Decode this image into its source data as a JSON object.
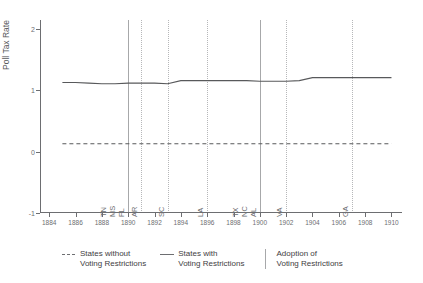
{
  "figure": {
    "title": "",
    "background": "#ffffff",
    "ink_color": "#6d6e71",
    "grid_color": "#b6b7b9"
  },
  "axes": {
    "y_title": "Poll Tax Rate",
    "y_ticks": [
      {
        "value": 2,
        "label": "2"
      },
      {
        "value": 1,
        "label": "1"
      },
      {
        "value": 0,
        "label": "0"
      },
      {
        "value": -1,
        "label": "-1"
      }
    ],
    "y_range": [
      -1,
      2.15
    ],
    "x_ticks": [
      {
        "value": 1884,
        "label": "1884"
      },
      {
        "value": 1886,
        "label": "1886"
      },
      {
        "value": 1888,
        "label": "1888"
      },
      {
        "value": 1890,
        "label": "1890"
      },
      {
        "value": 1892,
        "label": "1892"
      },
      {
        "value": 1894,
        "label": "1894"
      },
      {
        "value": 1896,
        "label": "1896"
      },
      {
        "value": 1898,
        "label": "1898"
      },
      {
        "value": 1900,
        "label": "1900"
      },
      {
        "value": 1902,
        "label": "1902"
      },
      {
        "value": 1904,
        "label": "1904"
      },
      {
        "value": 1906,
        "label": "1906"
      },
      {
        "value": 1908,
        "label": "1908"
      },
      {
        "value": 1910,
        "label": "1910"
      }
    ],
    "x_range": [
      1883.3,
      1910.8
    ],
    "grid": false
  },
  "legend": {
    "position": "below-plot",
    "entries": [
      {
        "marker": "dashed-line",
        "line1": "States without",
        "line2": "Voting Restrictions"
      },
      {
        "marker": "solid-line",
        "line1": "States with",
        "line2": "Voting Restrictions"
      },
      {
        "marker": "vertical-line",
        "line1": "Adoption of",
        "line2": "Voting Restrictions"
      }
    ]
  },
  "events": [
    {
      "year": 1890,
      "labels": [
        "FL",
        "MS",
        "TN"
      ]
    },
    {
      "year": 1891,
      "labels": [
        "AR"
      ]
    },
    {
      "year": 1893,
      "labels": [
        "SC"
      ]
    },
    {
      "year": 1896,
      "labels": [
        "LA"
      ]
    },
    {
      "year": 1900,
      "labels": [
        "AL",
        "NC",
        "TX"
      ]
    },
    {
      "year": 1902,
      "labels": [
        "VA"
      ]
    },
    {
      "year": 1907,
      "labels": [
        "GA"
      ]
    }
  ],
  "chart_data": {
    "type": "line",
    "title": "",
    "xlabel": "",
    "ylabel": "Poll Tax Rate",
    "xlim": [
      1883.3,
      1910.8
    ],
    "ylim": [
      -1,
      2.15
    ],
    "grid": false,
    "legend_position": "below",
    "x": [
      1885,
      1886,
      1887,
      1888,
      1889,
      1890,
      1891,
      1892,
      1893,
      1894,
      1895,
      1896,
      1897,
      1898,
      1899,
      1900,
      1901,
      1902,
      1903,
      1904,
      1905,
      1906,
      1907,
      1908,
      1909,
      1910
    ],
    "series": [
      {
        "name": "States with Voting Restrictions",
        "style": "solid",
        "color": "#58595b",
        "values": [
          1.13,
          1.13,
          1.12,
          1.11,
          1.11,
          1.12,
          1.12,
          1.12,
          1.11,
          1.16,
          1.16,
          1.16,
          1.16,
          1.16,
          1.16,
          1.15,
          1.15,
          1.15,
          1.16,
          1.21,
          1.21,
          1.21,
          1.21,
          1.21,
          1.21,
          1.21
        ]
      },
      {
        "name": "States without Voting Restrictions",
        "style": "dashed",
        "color": "#58595b",
        "values": [
          0.13,
          0.13,
          0.13,
          0.13,
          0.13,
          0.13,
          0.13,
          0.13,
          0.13,
          0.13,
          0.13,
          0.13,
          0.13,
          0.13,
          0.13,
          0.13,
          0.13,
          0.13,
          0.13,
          0.13,
          0.13,
          0.13,
          0.13,
          0.13,
          0.13,
          0.13
        ]
      }
    ],
    "annotations": [
      {
        "year": 1890,
        "text": "FL MS TN",
        "kind": "vertical-rule"
      },
      {
        "year": 1891,
        "text": "AR",
        "kind": "vertical-rule"
      },
      {
        "year": 1893,
        "text": "SC",
        "kind": "vertical-rule"
      },
      {
        "year": 1896,
        "text": "LA",
        "kind": "vertical-rule"
      },
      {
        "year": 1900,
        "text": "AL NC TX",
        "kind": "vertical-rule"
      },
      {
        "year": 1902,
        "text": "VA",
        "kind": "vertical-rule"
      },
      {
        "year": 1907,
        "text": "GA",
        "kind": "vertical-rule"
      }
    ]
  }
}
